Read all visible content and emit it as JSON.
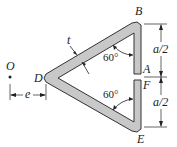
{
  "diagram": {
    "labels": {
      "B": "B",
      "A": "A",
      "F": "F",
      "E": "E",
      "D": "D",
      "O": "O",
      "t": "t",
      "e": "e"
    },
    "angles": {
      "top": "60°",
      "bottom": "60°"
    },
    "dimensions": {
      "upper": "a/2",
      "lower": "a/2"
    },
    "colors": {
      "section_fill": "#c8c8c8",
      "section_stroke": "#333333",
      "line": "#222222"
    }
  }
}
